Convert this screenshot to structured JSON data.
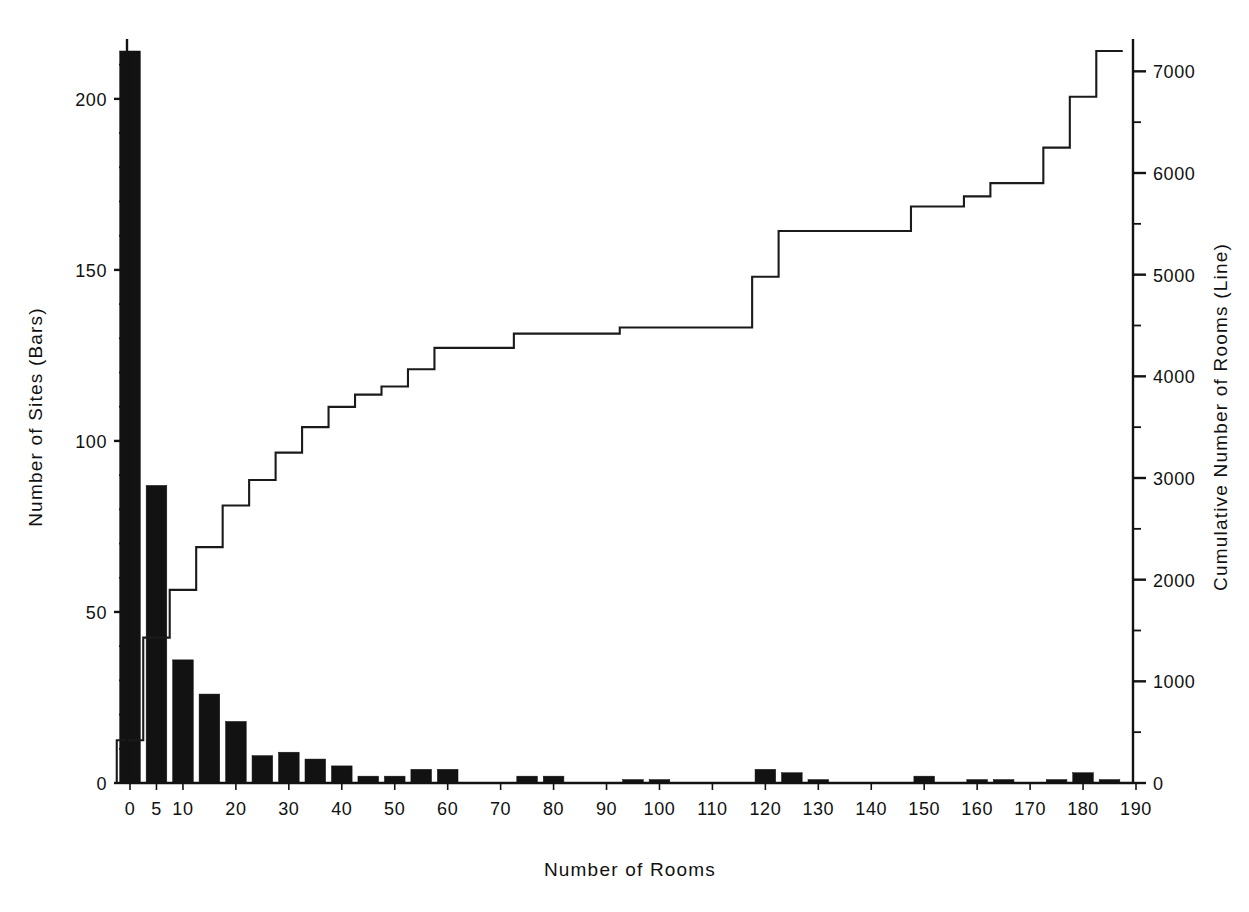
{
  "chart_data": {
    "type": "bar",
    "title": "",
    "xlabel": "Number of Rooms",
    "ylabel": "Number of Sites (Bars)",
    "y2label": "Cumulative Number of Rooms (Line)",
    "grid": false,
    "legend": "none",
    "xlim": [
      -2.5,
      192.5
    ],
    "ylim": [
      0,
      215
    ],
    "y2lim": [
      0,
      7250
    ],
    "bin_width": 5,
    "x_ticks": [
      0,
      5,
      10,
      20,
      30,
      40,
      50,
      60,
      70,
      80,
      90,
      100,
      110,
      120,
      130,
      140,
      150,
      160,
      170,
      180,
      190
    ],
    "x_tick_labels": [
      "0",
      "5",
      "10",
      "20",
      "30",
      "40",
      "50",
      "60",
      "70",
      "80",
      "90",
      "100",
      "110",
      "120",
      "130",
      "140",
      "150",
      "160",
      "170",
      "180",
      "190"
    ],
    "y_ticks": [
      0,
      50,
      100,
      150,
      200
    ],
    "y_tick_labels": [
      "0",
      "50",
      "100",
      "150",
      "200"
    ],
    "y_minor_step": 10,
    "y2_ticks": [
      0,
      1000,
      2000,
      3000,
      4000,
      5000,
      6000,
      7000
    ],
    "y2_tick_labels": [
      "0",
      "1000",
      "2000",
      "3000",
      "4000",
      "5000",
      "6000",
      "7000"
    ],
    "y2_minor_step": 500,
    "bar_color": "#121212",
    "line_color": "#1a1a1a",
    "axis_color": "#121212",
    "categories": [
      0,
      5,
      10,
      15,
      20,
      25,
      30,
      35,
      40,
      45,
      50,
      55,
      60,
      65,
      70,
      75,
      80,
      85,
      90,
      95,
      100,
      105,
      110,
      115,
      120,
      125,
      130,
      135,
      140,
      145,
      150,
      155,
      160,
      165,
      170,
      175,
      180,
      185
    ],
    "series": [
      {
        "name": "Number of Sites (Bars)",
        "axis": "left",
        "values": [
          214,
          87,
          36,
          26,
          18,
          8,
          9,
          7,
          5,
          2,
          2,
          4,
          4,
          0,
          0,
          2,
          2,
          0,
          0,
          1,
          1,
          0,
          0,
          0,
          4,
          3,
          1,
          0,
          0,
          0,
          2,
          0,
          1,
          1,
          0,
          1,
          3,
          1
        ]
      },
      {
        "name": "Cumulative Number of Rooms (Line)",
        "axis": "right",
        "values": [
          420,
          1430,
          1900,
          2320,
          2730,
          2980,
          3250,
          3500,
          3700,
          3820,
          3900,
          4070,
          4280,
          4280,
          4280,
          4420,
          4420,
          4420,
          4420,
          4480,
          4480,
          4480,
          4480,
          4480,
          4980,
          5430,
          5430,
          5430,
          5430,
          5430,
          5670,
          5670,
          5770,
          5900,
          5900,
          6250,
          6750,
          7200
        ]
      }
    ]
  }
}
